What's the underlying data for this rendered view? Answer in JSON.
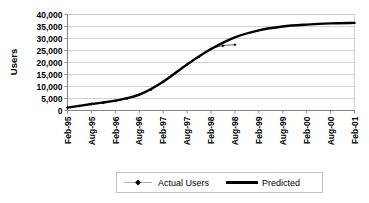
{
  "chart_data": {
    "type": "line",
    "title": "",
    "xlabel": "",
    "ylabel": "Users",
    "ylim": [
      0,
      40000
    ],
    "grid": true,
    "legend_position": "bottom",
    "categories": [
      "Feb-95",
      "Aug-95",
      "Feb-96",
      "Aug-96",
      "Feb-97",
      "Aug-97",
      "Feb-98",
      "Aug-98",
      "Feb-99",
      "Aug-99",
      "Feb-00",
      "Aug-00",
      "Feb-01"
    ],
    "ytick_labels": [
      "0",
      "5,000",
      "10,000",
      "15,000",
      "20,000",
      "25,000",
      "30,000",
      "35,000",
      "40,000"
    ],
    "ytick_values": [
      0,
      5000,
      10000,
      15000,
      20000,
      25000,
      30000,
      35000,
      40000
    ],
    "series": [
      {
        "name": "Actual Users",
        "style": "thin-line-with-markers",
        "color": "#000000",
        "x": [
          "Feb-95",
          "May-95",
          "Aug-95",
          "Nov-95",
          "Feb-96",
          "May-96",
          "Aug-96",
          "Nov-96",
          "Feb-97",
          "May-97",
          "Aug-97",
          "Nov-97",
          "Feb-98",
          "May-98",
          "Aug-98"
        ],
        "values": [
          1200,
          1900,
          2700,
          3200,
          4000,
          5000,
          6600,
          8800,
          12000,
          15500,
          19200,
          22400,
          25600,
          27000,
          27400
        ]
      },
      {
        "name": "Predicted",
        "style": "thick-line",
        "color": "#000000",
        "x": [
          "Feb-95",
          "Aug-95",
          "Feb-96",
          "Aug-96",
          "Feb-97",
          "Aug-97",
          "Feb-98",
          "Aug-98",
          "Feb-99",
          "Aug-99",
          "Feb-00",
          "Aug-00",
          "Feb-01"
        ],
        "values": [
          1200,
          2700,
          4100,
          6600,
          12000,
          19200,
          25600,
          30500,
          33400,
          35000,
          35800,
          36300,
          36500
        ]
      }
    ]
  },
  "legend": {
    "items": [
      {
        "label": "Actual Users",
        "marker": "diamond-with-line"
      },
      {
        "label": "Predicted",
        "marker": "thick-line"
      }
    ]
  },
  "colors": {
    "series": "#000000",
    "gridline": "#bfbfbf",
    "axis": "#6e6e6e",
    "background": "#ffffff"
  }
}
